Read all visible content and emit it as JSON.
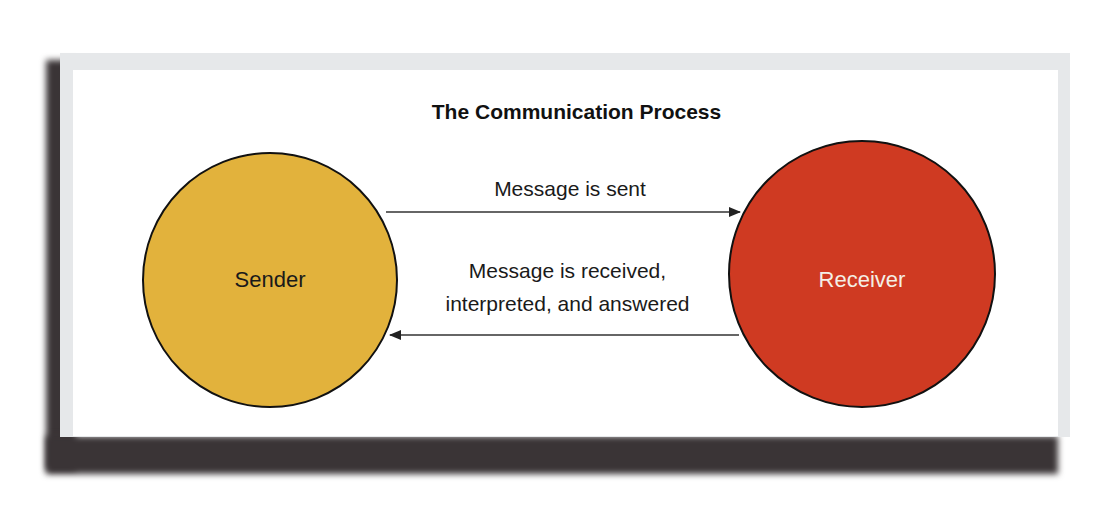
{
  "diagram": {
    "title": "The Communication Process",
    "nodes": [
      {
        "id": "sender",
        "label": "Sender",
        "fill": "#e2b23c",
        "text_color": "#1a1a1a"
      },
      {
        "id": "receiver",
        "label": "Receiver",
        "fill": "#cf3a22",
        "text_color": "#f4efe6"
      }
    ],
    "edges": [
      {
        "from": "sender",
        "to": "receiver",
        "label": "Message is sent"
      },
      {
        "from": "receiver",
        "to": "sender",
        "label_line1": "Message is received,",
        "label_line2": "interpreted, and answered"
      }
    ],
    "colors": {
      "panel": "#ffffff",
      "frame_shadow": "#3a3436",
      "arrow": "#333333",
      "circle_stroke": "#111111"
    }
  }
}
